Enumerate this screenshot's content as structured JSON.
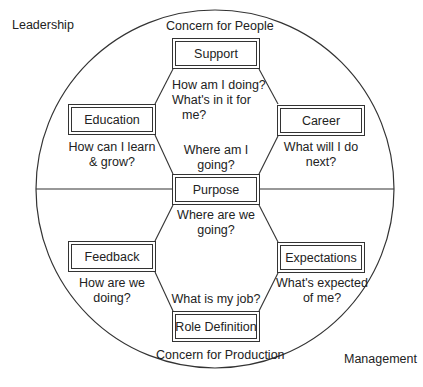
{
  "corner_labels": {
    "top_left": "Leadership",
    "bottom_right": "Management"
  },
  "axis_labels": {
    "top": "Concern for People",
    "bottom": "Concern for Production"
  },
  "nodes": [
    {
      "id": "support",
      "label": "Support"
    },
    {
      "id": "education",
      "label": "Education"
    },
    {
      "id": "career",
      "label": "Career"
    },
    {
      "id": "purpose",
      "label": "Purpose"
    },
    {
      "id": "feedback",
      "label": "Feedback"
    },
    {
      "id": "expectations",
      "label": "Expectations"
    },
    {
      "id": "role_definition",
      "label": "Role Definition"
    }
  ],
  "questions": {
    "support": [
      "How am I doing?",
      "What's in it for",
      "me?"
    ],
    "education": [
      "How can I learn",
      "& grow?"
    ],
    "career": [
      "What will I do",
      "next?"
    ],
    "purpose_upper": [
      "Where am I",
      "going?"
    ],
    "purpose_lower": [
      "Where are we",
      "going?"
    ],
    "feedback": [
      "How are we",
      "doing?"
    ],
    "expectations": [
      "What's expected",
      "of me?"
    ],
    "role_definition": [
      "What is my job?"
    ]
  },
  "colors": {
    "line": "#333333",
    "text": "#222222",
    "background": "#ffffff"
  }
}
